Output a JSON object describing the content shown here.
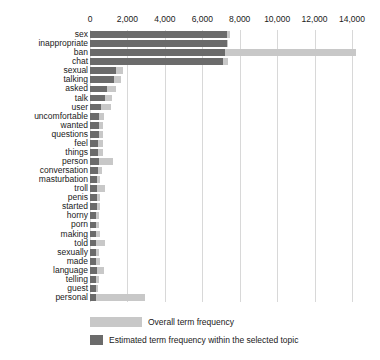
{
  "chart_data": {
    "type": "bar",
    "orientation": "horizontal",
    "title": "",
    "xlabel": "",
    "ylabel": "",
    "xlim": [
      0,
      14000
    ],
    "xticks": [
      0,
      2000,
      4000,
      6000,
      8000,
      10000,
      12000,
      14000
    ],
    "xtick_labels": [
      "0",
      "2,000",
      "4,000",
      "6,000",
      "8,000",
      "10,000",
      "12,000",
      "14,000"
    ],
    "grid": true,
    "legend_position": "bottom",
    "colors": {
      "overall": "#c8c8c8",
      "topic": "#6b6b6b",
      "gridline": "#d8d8d8",
      "text": "#1a1a1a",
      "background": "#ffffff"
    },
    "categories": [
      "sex",
      "inappropriate",
      "ban",
      "chat",
      "sexual",
      "talking",
      "asked",
      "talk",
      "user",
      "uncomfortable",
      "wanted",
      "questions",
      "feel",
      "things",
      "person",
      "conversation",
      "masturbation",
      "troll",
      "penis",
      "started",
      "horny",
      "porn",
      "making",
      "told",
      "sexually",
      "made",
      "language",
      "telling",
      "guest",
      "personal"
    ],
    "series": [
      {
        "name": "Overall term frequency",
        "color": "#c8c8c8",
        "values": [
          7500,
          7400,
          14200,
          7400,
          1750,
          1650,
          1400,
          1150,
          1100,
          760,
          720,
          700,
          690,
          700,
          1250,
          640,
          560,
          800,
          540,
          530,
          470,
          460,
          560,
          800,
          470,
          520,
          740,
          460,
          450,
          2950
        ]
      },
      {
        "name": "Estimated term frequency within the selected topic",
        "color": "#6b6b6b",
        "values": [
          7300,
          7300,
          7200,
          7100,
          1400,
          1300,
          900,
          780,
          600,
          480,
          470,
          460,
          450,
          450,
          480,
          420,
          400,
          360,
          370,
          350,
          330,
          320,
          330,
          340,
          320,
          330,
          350,
          320,
          310,
          300
        ]
      }
    ]
  },
  "legend": {
    "items": [
      {
        "label": "Overall term frequency",
        "color": "#c8c8c8",
        "swatch_width": 52
      },
      {
        "label": "Estimated term frequency within the selected topic",
        "color": "#6b6b6b",
        "swatch_width": 13
      }
    ]
  }
}
